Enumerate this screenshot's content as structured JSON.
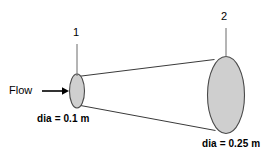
{
  "figure": {
    "type": "diverging-conical-duct-diagram",
    "background_color": "#ffffff",
    "line_color": "#3a3a3a",
    "fill_color": "#cfcfcf",
    "stroke_color": "#4a4a4a",
    "stations": [
      {
        "id": "1",
        "label": "1",
        "diameter_label": "dia = 0.1 m",
        "diameter_value": 0.1,
        "unit": "m"
      },
      {
        "id": "2",
        "label": "2",
        "diameter_label": "dia = 0.25 m",
        "diameter_value": 0.25,
        "unit": "m"
      }
    ],
    "flow": {
      "label": "Flow",
      "direction": "left-to-right"
    }
  }
}
